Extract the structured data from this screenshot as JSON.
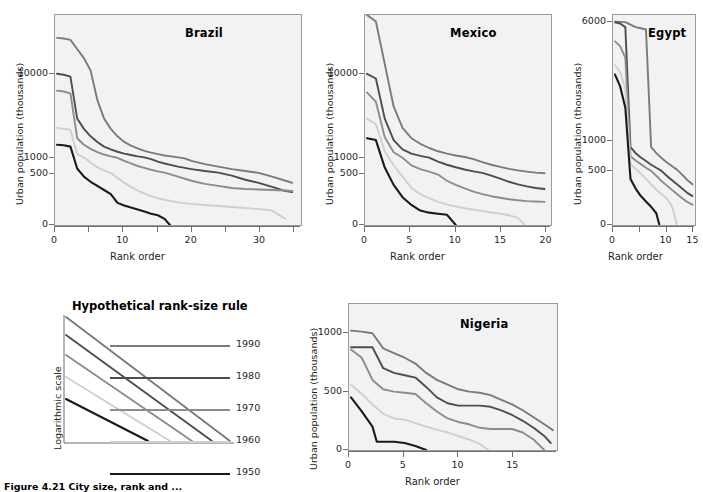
{
  "figure": {
    "caption": "Figure 4.21  City size, rank and ...",
    "axis_labels": {
      "y": "Urban population (thousands)",
      "x": "Rank order",
      "y_log": "Logarithmic scale"
    }
  },
  "series_colors": {
    "1950": "#1a1a1a",
    "1960": "#cfcfcf",
    "1970": "#8c8c8c",
    "1980": "#4d4d4d",
    "1990": "#7a7a7a"
  },
  "legend": {
    "title": "Hypothetical rank-size rule",
    "ylabel": "Logarithmic scale",
    "years": [
      "1990",
      "1980",
      "1970",
      "1960",
      "1950"
    ]
  },
  "chart_data": [
    {
      "type": "line",
      "title": "Brazil",
      "xlabel": "Rank order",
      "ylabel": "Urban population (thousands)",
      "xlim": [
        0,
        36
      ],
      "xticks": [
        0,
        10,
        20,
        30
      ],
      "xminor": [
        5,
        15,
        25,
        35
      ],
      "yscale": "log-like",
      "yticks": [
        0,
        500,
        1000,
        10000
      ],
      "grid": false,
      "legend_position": "external",
      "series": [
        {
          "name": "1990",
          "x": [
            0,
            1,
            2,
            3,
            4,
            5,
            6,
            7,
            8,
            9,
            10,
            11,
            12,
            13,
            14,
            15,
            16,
            17,
            18,
            19,
            20,
            22,
            24,
            26,
            28,
            30,
            32,
            34,
            35
          ],
          "values": [
            15500,
            15400,
            15200,
            13800,
            12400,
            10500,
            7200,
            5200,
            4100,
            3300,
            2700,
            2300,
            2000,
            1750,
            1550,
            1400,
            1250,
            1150,
            1050,
            980,
            900,
            800,
            720,
            640,
            580,
            520,
            470,
            430,
            410
          ]
        },
        {
          "name": "1980",
          "x": [
            0,
            1,
            2,
            3,
            4,
            5,
            6,
            7,
            8,
            9,
            10,
            11,
            12,
            13,
            14,
            15,
            16,
            18,
            20,
            22,
            24,
            26,
            28,
            30,
            32,
            34,
            35
          ],
          "values": [
            10000,
            9900,
            9700,
            5200,
            4100,
            3300,
            2700,
            2200,
            1900,
            1650,
            1450,
            1300,
            1150,
            1050,
            960,
            880,
            820,
            720,
            640,
            580,
            530,
            480,
            440,
            410,
            370,
            330,
            320
          ]
        },
        {
          "name": "1970",
          "x": [
            0,
            1,
            2,
            3,
            4,
            5,
            6,
            7,
            8,
            9,
            10,
            11,
            12,
            13,
            14,
            15,
            16,
            18,
            20,
            22,
            24,
            26,
            28,
            30,
            32,
            34,
            35
          ],
          "values": [
            8200,
            8100,
            7900,
            3100,
            2400,
            1950,
            1600,
            1350,
            1150,
            1000,
            900,
            820,
            740,
            680,
            620,
            570,
            530,
            470,
            430,
            400,
            380,
            360,
            350,
            345,
            340,
            335,
            330
          ]
        },
        {
          "name": "1960",
          "x": [
            0,
            1,
            2,
            3,
            4,
            5,
            6,
            7,
            8,
            9,
            10,
            11,
            12,
            13,
            14,
            15,
            16,
            18,
            20,
            22,
            24,
            26,
            28,
            30,
            32,
            34
          ],
          "values": [
            4200,
            4100,
            4000,
            1400,
            1050,
            850,
            700,
            600,
            520,
            460,
            410,
            370,
            335,
            305,
            280,
            260,
            245,
            220,
            205,
            195,
            185,
            175,
            165,
            155,
            140,
            60
          ]
        },
        {
          "name": "1950",
          "x": [
            0,
            1,
            2,
            3,
            4,
            5,
            6,
            7,
            8,
            9,
            10,
            11,
            12,
            13,
            14,
            15,
            16,
            16.8
          ],
          "values": [
            2400,
            2350,
            2200,
            660,
            470,
            420,
            380,
            340,
            300,
            215,
            190,
            170,
            150,
            130,
            110,
            95,
            60,
            0
          ]
        }
      ]
    },
    {
      "type": "line",
      "title": "Mexico",
      "xlabel": "Rank order",
      "ylabel": "Urban population (thousands)",
      "xlim": [
        0,
        20.5
      ],
      "xticks": [
        0,
        5,
        10,
        15,
        20
      ],
      "yscale": "log-like",
      "yticks": [
        0,
        500,
        1000,
        10000
      ],
      "grid": false,
      "series": [
        {
          "name": "1990",
          "x": [
            0,
            1,
            2,
            3,
            4,
            5,
            6,
            7,
            8,
            9,
            10,
            11,
            12,
            13,
            14,
            15,
            16,
            17,
            18,
            19,
            20
          ],
          "values": [
            19000,
            18000,
            11500,
            6500,
            4200,
            3100,
            2500,
            2050,
            1700,
            1450,
            1250,
            1080,
            960,
            860,
            780,
            710,
            650,
            600,
            560,
            530,
            510
          ]
        },
        {
          "name": "1980",
          "x": [
            0,
            1,
            2,
            3,
            4,
            5,
            6,
            7,
            8,
            9,
            10,
            11,
            12,
            13,
            14,
            15,
            16,
            17,
            18,
            19,
            20
          ],
          "values": [
            10000,
            9500,
            5200,
            2900,
            1900,
            1450,
            1200,
            1020,
            880,
            780,
            700,
            630,
            570,
            520,
            480,
            450,
            420,
            395,
            375,
            360,
            350
          ]
        },
        {
          "name": "1970",
          "x": [
            0,
            1,
            2,
            3,
            4,
            5,
            6,
            7,
            8,
            9,
            10,
            11,
            12,
            13,
            14,
            15,
            16,
            17,
            18,
            19,
            20
          ],
          "values": [
            8000,
            7000,
            3200,
            1600,
            1000,
            760,
            640,
            560,
            490,
            430,
            390,
            355,
            325,
            300,
            280,
            265,
            250,
            240,
            232,
            228,
            225
          ]
        },
        {
          "name": "1960",
          "x": [
            0,
            1,
            2,
            3,
            4,
            5,
            6,
            7,
            8,
            9,
            10,
            11,
            12,
            13,
            14,
            15,
            16,
            17,
            17.8
          ],
          "values": [
            5200,
            4600,
            1700,
            760,
            470,
            360,
            300,
            260,
            225,
            200,
            180,
            163,
            148,
            135,
            122,
            110,
            95,
            70,
            0
          ]
        },
        {
          "name": "1950",
          "x": [
            0,
            1,
            2,
            3,
            4,
            5,
            6,
            7,
            8,
            9,
            10
          ],
          "values": [
            3100,
            2900,
            690,
            390,
            270,
            195,
            140,
            120,
            110,
            100,
            0
          ]
        }
      ]
    },
    {
      "type": "line",
      "title": "Egypt",
      "xlabel": "Rank order",
      "ylabel": "Urban population (thousands)",
      "xlim": [
        0,
        15.3
      ],
      "xticks": [
        0,
        10,
        15
      ],
      "xminor": [
        5
      ],
      "yscale": "linear-break",
      "yticks": [
        0,
        500,
        1000,
        6000
      ],
      "grid": false,
      "series": [
        {
          "name": "1990",
          "x": [
            0,
            1,
            2,
            3,
            4,
            5,
            6,
            7,
            8,
            9,
            10,
            11,
            12,
            13,
            14,
            15
          ],
          "values": [
            6400,
            6350,
            6200,
            5900,
            5800,
            5750,
            5700,
            900,
            800,
            720,
            650,
            590,
            530,
            470,
            420,
            380
          ]
        },
        {
          "name": "1980",
          "x": [
            0,
            1,
            2,
            3,
            4,
            5,
            6,
            7,
            8,
            9,
            10,
            11,
            12,
            13,
            14,
            15
          ],
          "values": [
            6000,
            5950,
            5800,
            900,
            800,
            730,
            670,
            610,
            560,
            510,
            460,
            420,
            380,
            340,
            300,
            270
          ]
        },
        {
          "name": "1970",
          "x": [
            0,
            1,
            2,
            3,
            4,
            5,
            6,
            7,
            8,
            9,
            10,
            11,
            12,
            13,
            14,
            15
          ],
          "values": [
            5200,
            5000,
            4500,
            750,
            680,
            620,
            560,
            510,
            460,
            410,
            370,
            330,
            290,
            250,
            215,
            190
          ]
        },
        {
          "name": "1960",
          "x": [
            0,
            1,
            2,
            3,
            4,
            5,
            6,
            7,
            8,
            9,
            10,
            11,
            12
          ],
          "values": [
            4200,
            3900,
            3200,
            620,
            540,
            480,
            430,
            380,
            330,
            290,
            250,
            180,
            0
          ]
        },
        {
          "name": "1950",
          "x": [
            0,
            1,
            2,
            3,
            4,
            5,
            6,
            7,
            8,
            8.6
          ],
          "values": [
            3800,
            3300,
            2400,
            430,
            340,
            270,
            220,
            170,
            110,
            0
          ]
        }
      ]
    },
    {
      "type": "line",
      "title": "Nigeria",
      "xlabel": "Rank order",
      "ylabel": "Urban population (thousands)",
      "xlim": [
        0,
        19
      ],
      "xticks": [
        0,
        5,
        10,
        15
      ],
      "yscale": "linear",
      "yticks": [
        0,
        500,
        1000
      ],
      "ylim": [
        0,
        1250
      ],
      "grid": false,
      "series": [
        {
          "name": "1990",
          "x": [
            0,
            1,
            2,
            3,
            4,
            5,
            6,
            7,
            8,
            9,
            10,
            11,
            12,
            13,
            14,
            15,
            16,
            17,
            18,
            18.8
          ],
          "values": [
            1080,
            1050,
            1000,
            870,
            830,
            790,
            740,
            660,
            600,
            560,
            520,
            500,
            490,
            470,
            430,
            390,
            340,
            280,
            220,
            170
          ]
        },
        {
          "name": "1980",
          "x": [
            0,
            1,
            2,
            3,
            4,
            5,
            6,
            7,
            8,
            9,
            10,
            11,
            12,
            13,
            14,
            15,
            16,
            17,
            18,
            18.6
          ],
          "values": [
            880,
            880,
            880,
            700,
            660,
            640,
            620,
            540,
            450,
            400,
            380,
            380,
            380,
            370,
            340,
            300,
            250,
            190,
            120,
            60
          ]
        },
        {
          "name": "1970",
          "x": [
            0,
            1,
            2,
            3,
            4,
            5,
            6,
            7,
            8,
            9,
            10,
            11,
            12,
            13,
            14,
            15,
            16,
            17,
            18
          ],
          "values": [
            860,
            790,
            600,
            520,
            500,
            490,
            480,
            400,
            330,
            270,
            240,
            220,
            190,
            180,
            180,
            180,
            150,
            90,
            0
          ]
        },
        {
          "name": "1960",
          "x": [
            0,
            1,
            2,
            3,
            4,
            5,
            6,
            7,
            8,
            9,
            10,
            11,
            12,
            12.8
          ],
          "values": [
            560,
            480,
            390,
            310,
            270,
            260,
            230,
            200,
            175,
            150,
            120,
            90,
            50,
            0
          ]
        },
        {
          "name": "1950",
          "x": [
            0,
            1,
            2,
            2.4,
            3,
            4,
            5,
            6,
            7
          ],
          "values": [
            450,
            330,
            200,
            70,
            70,
            70,
            60,
            35,
            0
          ]
        }
      ]
    }
  ]
}
